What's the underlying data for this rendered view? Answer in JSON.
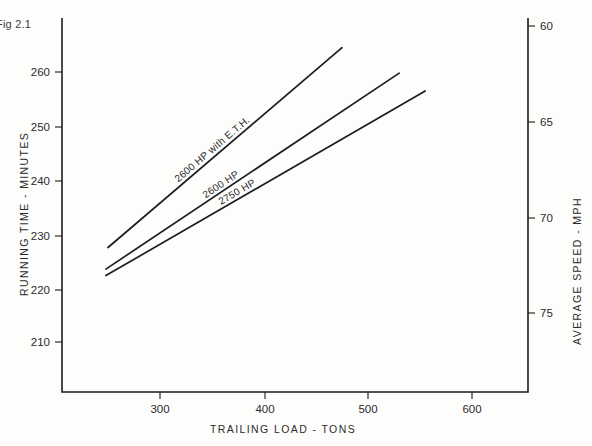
{
  "figure": {
    "caption": "Fig 2.1"
  },
  "chart_data": {
    "type": "line",
    "title": "Fig 2.1",
    "xlabel": "TRAILING LOAD - TONS",
    "ylabel": "RUNNING TIME - MINUTES",
    "y2label": "AVERAGE SPEED - MPH",
    "xlim": [
      230,
      640
    ],
    "ylim": [
      205,
      266
    ],
    "y2lim": [
      59.3,
      76.5
    ],
    "grid": false,
    "legend": "inline-labels",
    "xticks": [
      300,
      400,
      500,
      600
    ],
    "xticklabels": [
      "300",
      "400",
      "500",
      "600"
    ],
    "yticks": [
      210,
      220,
      230,
      240,
      250,
      260
    ],
    "yticklabels": [
      "210",
      "220",
      "230",
      "240",
      "250",
      "260"
    ],
    "y2ticks": [
      60,
      65,
      70,
      75
    ],
    "y2ticklabels": [
      "60",
      "65",
      "70",
      "75"
    ],
    "series": [
      {
        "name": "2600 HP with E.T.H.",
        "label": "2600 HP with E.T.H.",
        "x": [
          250,
          475
        ],
        "y": [
          227.5,
          264.5
        ]
      },
      {
        "name": "2600 HP",
        "label": "2600 HP",
        "x": [
          248,
          530
        ],
        "y": [
          223.5,
          259.8
        ]
      },
      {
        "name": "2750 HP",
        "label": "2750 HP",
        "x": [
          248,
          555
        ],
        "y": [
          222.3,
          256.5
        ]
      }
    ]
  }
}
